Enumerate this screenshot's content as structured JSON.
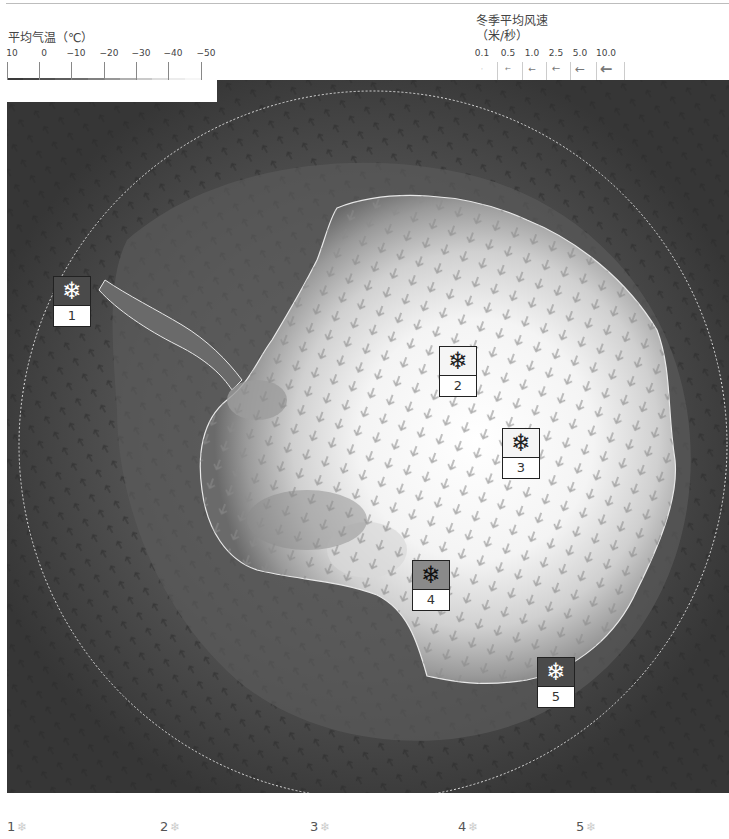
{
  "legend_temperature": {
    "title": "平均气温（℃）",
    "ticks": [
      "10",
      "0",
      "−10",
      "−20",
      "−30",
      "−40",
      "−50"
    ],
    "swatch_colors": [
      "#3a3a3a",
      "#444444",
      "#505050",
      "#5e5e5e",
      "#6e6e6e",
      "#808080",
      "#979797",
      "#b0b0b0",
      "#cacaca",
      "#dedede",
      "#ececec",
      "#f6f6f6",
      "#ffffff"
    ]
  },
  "legend_wind": {
    "title_line1": "冬季平均风速",
    "title_line2": "（米/秒）",
    "ticks": [
      {
        "label": "0.1",
        "arrow": "·"
      },
      {
        "label": "0.5",
        "arrow": "←"
      },
      {
        "label": "1.0",
        "arrow": "←"
      },
      {
        "label": "2.5",
        "arrow": "←"
      },
      {
        "label": "5.0",
        "arrow": "←"
      },
      {
        "label": "10.0",
        "arrow": "←"
      }
    ]
  },
  "map": {
    "ocean_color": "#3c3c3c",
    "coast_color": "#e6e6e6",
    "circle_color": "#dddddd",
    "stations": [
      {
        "id": "1",
        "icon": "snowflake-icon",
        "symbol": "❄",
        "x": 46,
        "y": 196,
        "style": "dark"
      },
      {
        "id": "2",
        "icon": "snowflake-icon",
        "symbol": "❄",
        "x": 432,
        "y": 266,
        "style": "light"
      },
      {
        "id": "3",
        "icon": "snowflake-icon",
        "symbol": "❄",
        "x": 495,
        "y": 348,
        "style": "light"
      },
      {
        "id": "4",
        "icon": "snowflake-icon",
        "symbol": "❄",
        "x": 405,
        "y": 480,
        "style": "mid"
      },
      {
        "id": "5",
        "icon": "snowflake-icon",
        "symbol": "❄",
        "x": 530,
        "y": 577,
        "style": "dark"
      }
    ]
  },
  "footer": {
    "items": [
      {
        "label": "1",
        "icon": "❄"
      },
      {
        "label": "2",
        "icon": "❄"
      },
      {
        "label": "3",
        "icon": "❄"
      },
      {
        "label": "4",
        "icon": "❄"
      },
      {
        "label": "5",
        "icon": "❄"
      }
    ]
  }
}
